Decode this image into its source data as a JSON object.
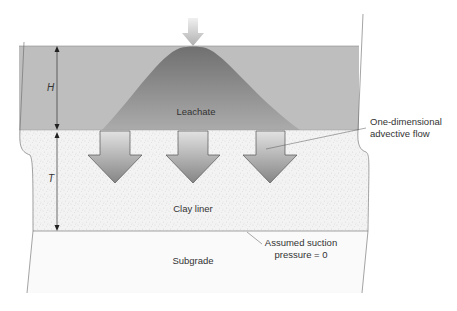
{
  "diagram": {
    "type": "cross-section",
    "layers": [
      {
        "id": "leachate",
        "label": "Leachate",
        "color": "#bdbdbd"
      },
      {
        "id": "clay-liner",
        "label": "Clay liner",
        "color": "#f2f2f2",
        "texture": "stippled"
      },
      {
        "id": "subgrade",
        "label": "Subgrade",
        "color": "#fafafa"
      }
    ],
    "dimensions": [
      {
        "symbol": "H",
        "meaning": "leachate head height"
      },
      {
        "symbol": "T",
        "meaning": "clay liner thickness"
      }
    ],
    "annotations": {
      "flow": [
        "One-dimensional",
        "advective flow"
      ],
      "bottom_condition": [
        "Assumed suction",
        "pressure = 0"
      ]
    },
    "flow_arrows": {
      "count": 3,
      "direction": "down"
    },
    "inflow_arrow": {
      "direction": "down",
      "position": "top-center"
    },
    "colors": {
      "mound_top": "#7a7a7a",
      "mound_base": "#a8a8a8",
      "arrow_top": "#dcdcdc",
      "arrow_bottom": "#8a8a8a",
      "outline": "#555555"
    }
  }
}
